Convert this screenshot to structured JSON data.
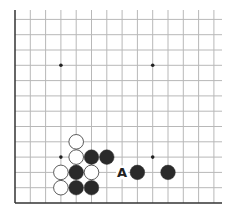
{
  "board": {
    "title": "Go board corner diagram",
    "origin": {
      "x": 15,
      "y": 203
    },
    "spacing": 15.3,
    "cols": 14,
    "rows": 13,
    "right_edge": 222,
    "top_edge": 10,
    "line_color": "#b8b8b8",
    "edge_color": "#333333",
    "star_points": [
      [
        3,
        9
      ],
      [
        9,
        9
      ],
      [
        3,
        3
      ],
      [
        9,
        3
      ]
    ],
    "stones": [
      {
        "color": "white",
        "col": 4,
        "row": 4
      },
      {
        "color": "white",
        "col": 4,
        "row": 3
      },
      {
        "color": "black",
        "col": 5,
        "row": 3
      },
      {
        "color": "black",
        "col": 6,
        "row": 3
      },
      {
        "color": "white",
        "col": 3,
        "row": 2
      },
      {
        "color": "black",
        "col": 4,
        "row": 2
      },
      {
        "color": "white",
        "col": 5,
        "row": 2
      },
      {
        "color": "black",
        "col": 8,
        "row": 2
      },
      {
        "color": "black",
        "col": 10,
        "row": 2
      },
      {
        "color": "white",
        "col": 3,
        "row": 1
      },
      {
        "color": "black",
        "col": 4,
        "row": 1
      },
      {
        "color": "black",
        "col": 5,
        "row": 1
      }
    ],
    "labels": [
      {
        "text": "A",
        "col": 7,
        "row": 2
      }
    ]
  }
}
